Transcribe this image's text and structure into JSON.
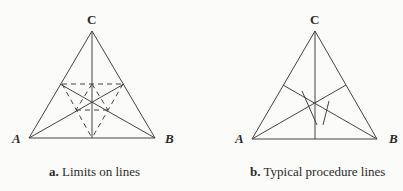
{
  "panels": [
    {
      "id": "a",
      "caption_letter": "a.",
      "caption_text": "Limits on lines",
      "vertices": {
        "A": "A",
        "B": "B",
        "C": "C"
      }
    },
    {
      "id": "b",
      "caption_letter": "b.",
      "caption_text": "Typical procedure lines",
      "vertices": {
        "A": "A",
        "B": "B",
        "C": "C"
      }
    }
  ],
  "colors": {
    "line": "#444444",
    "background": "#fbfbf9"
  }
}
